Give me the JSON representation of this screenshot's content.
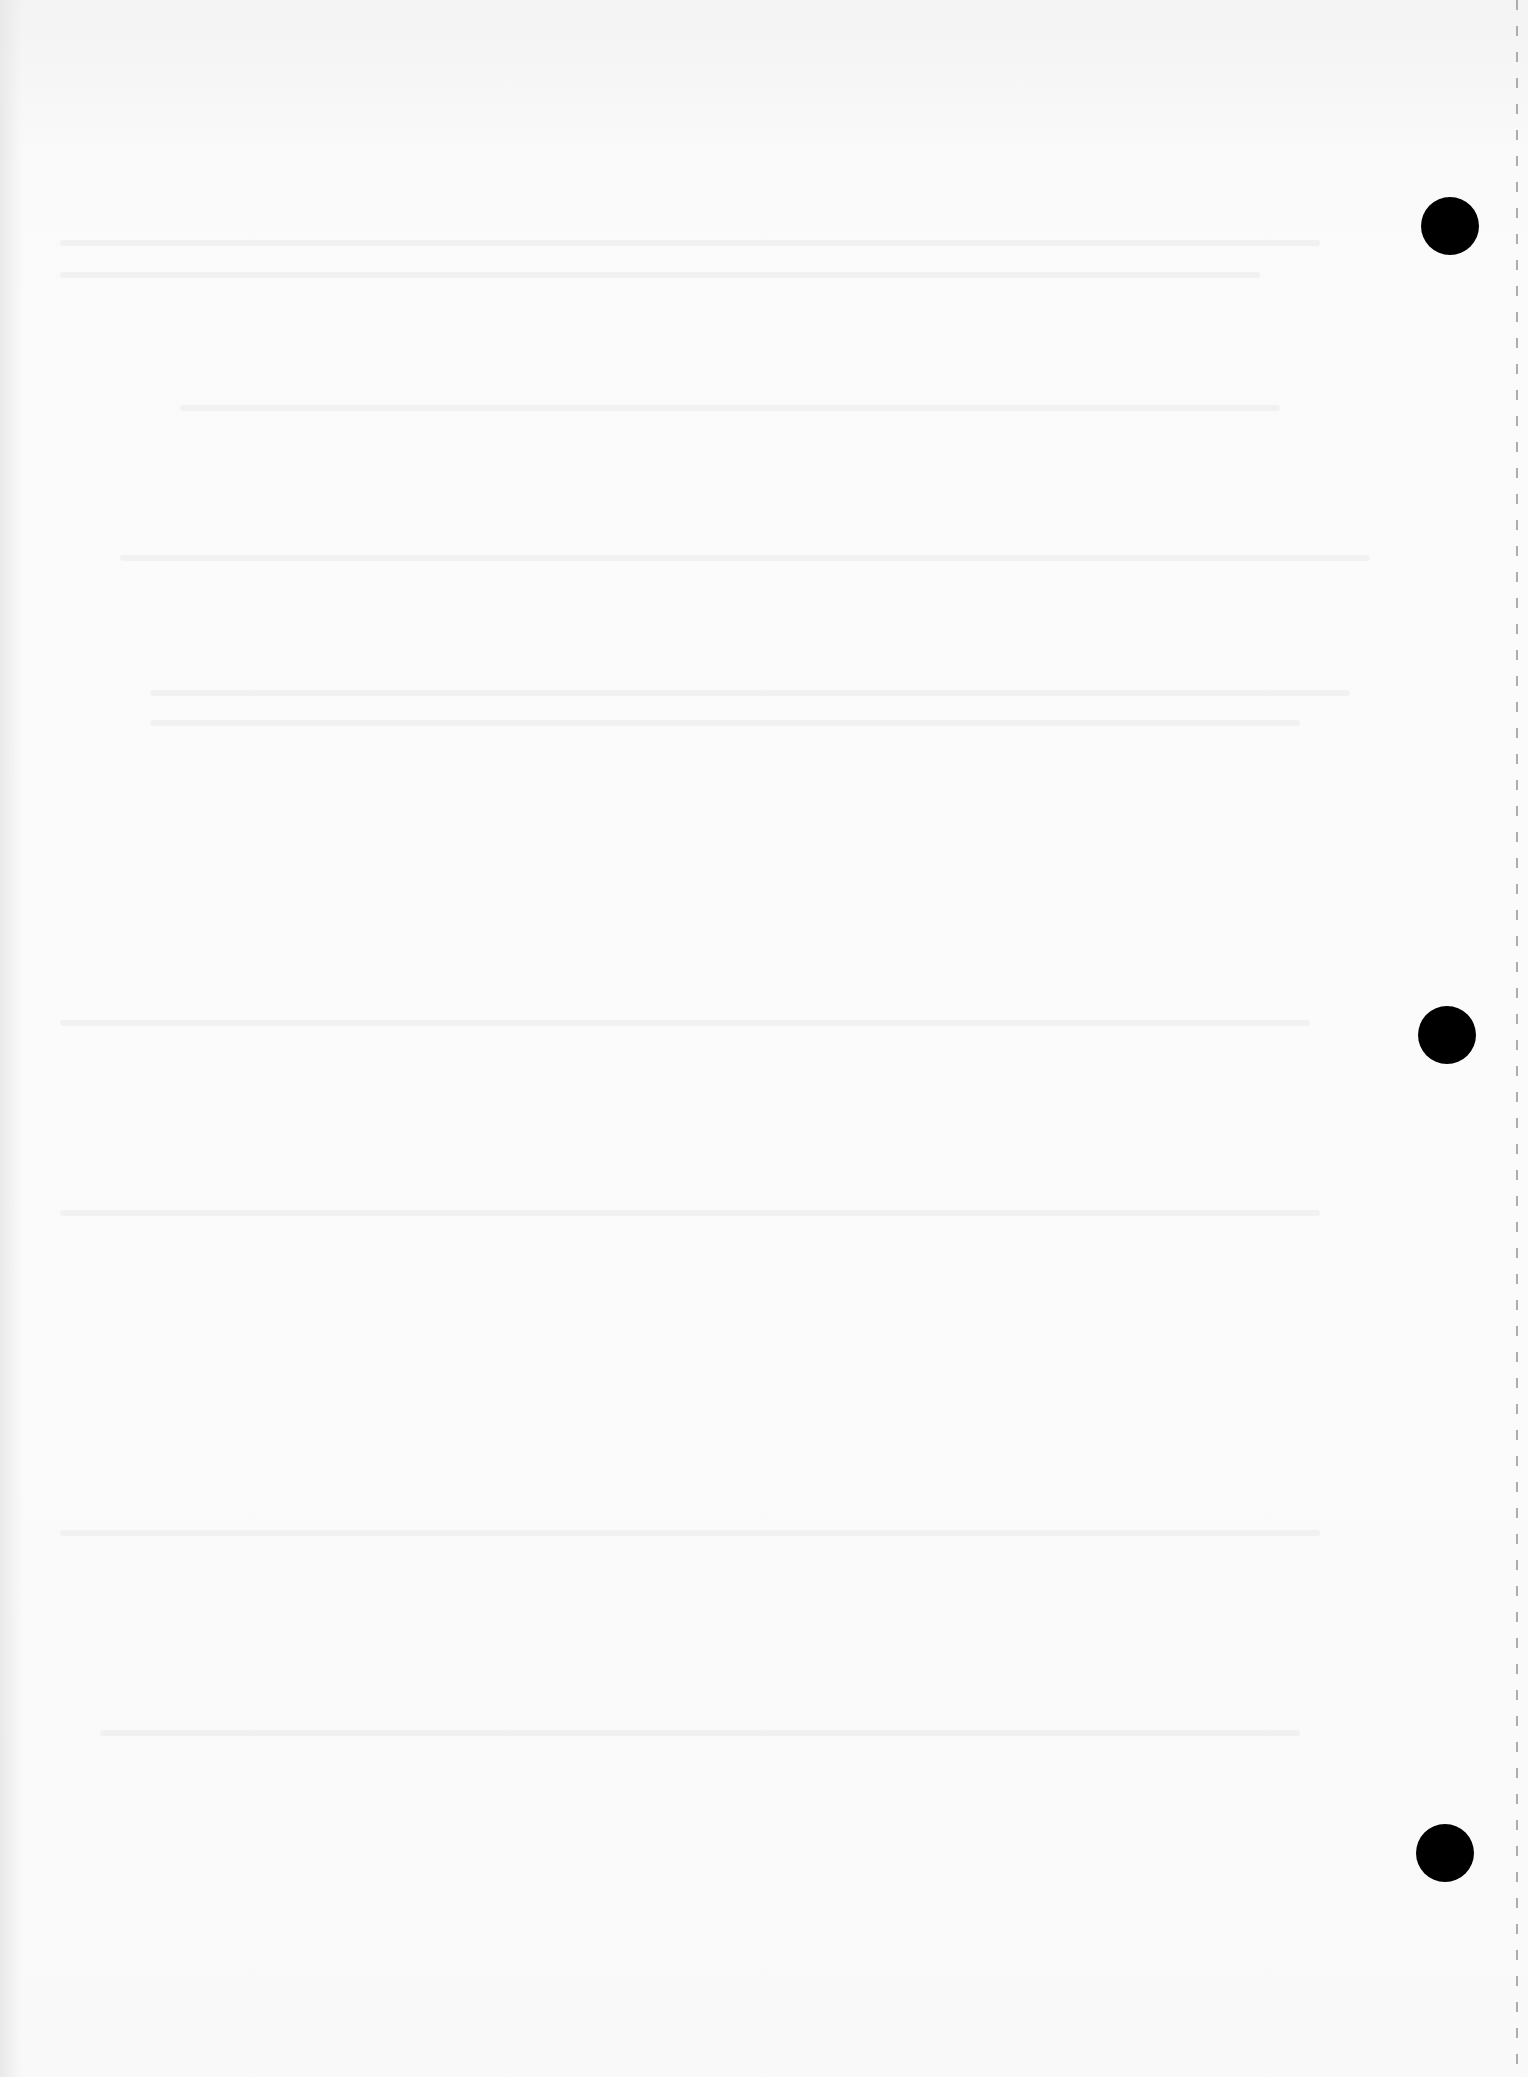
{
  "document": {
    "type": "blank scanned page",
    "text": "",
    "features": {
      "punch_holes": 3,
      "perforated_edge": "right",
      "colors": {
        "paper": "#fbfbfb",
        "hole": "#000000",
        "perforation": "#9a9a9a"
      }
    }
  }
}
